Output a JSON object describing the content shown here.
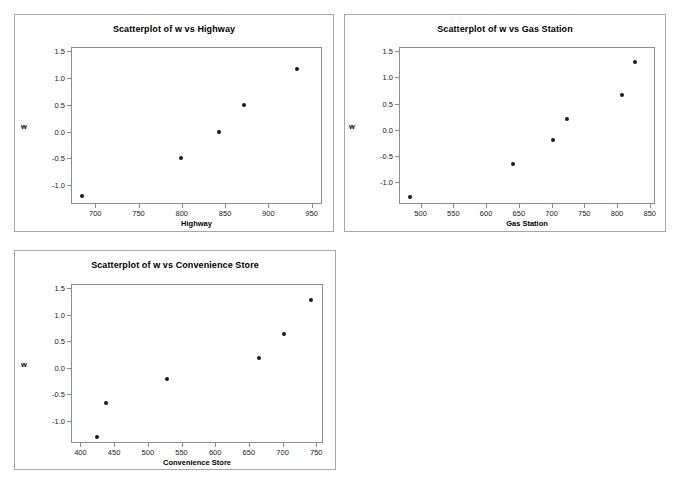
{
  "page": {
    "background": "#ffffff",
    "panel_border_color": "#a8a8a8",
    "frame_border_color": "#8c8c8c",
    "marker_color": "#1a1a1a"
  },
  "chart_data": [
    {
      "id": "highway",
      "type": "scatter",
      "title": "Scatterplot of w vs Highway",
      "xlabel": "Highway",
      "ylabel": "w",
      "xlim": [
        672,
        962
      ],
      "ylim": [
        -1.35,
        1.58
      ],
      "xticks": [
        700,
        750,
        800,
        850,
        900,
        950
      ],
      "yticks": [
        1.5,
        1.0,
        0.5,
        0.0,
        -0.5,
        -1.0
      ],
      "xtick_labels": [
        "700",
        "750",
        "800",
        "850",
        "900",
        "950"
      ],
      "ytick_labels": [
        "1.5",
        "1.0",
        "0.5",
        "0.0",
        "-0.5",
        "-1.0"
      ],
      "grid": false,
      "legend": "none",
      "x": [
        684,
        798,
        842,
        871,
        932
      ],
      "y": [
        -1.18,
        -0.48,
        0.02,
        0.52,
        1.19
      ]
    },
    {
      "id": "gasstation",
      "type": "scatter",
      "title": "Scatterplot of w vs Gas Station",
      "xlabel": "Gas Station",
      "ylabel": "w",
      "xlim": [
        467,
        858
      ],
      "ylim": [
        -1.42,
        1.58
      ],
      "xticks": [
        500,
        550,
        600,
        650,
        700,
        750,
        800,
        850
      ],
      "yticks": [
        1.5,
        1.0,
        0.5,
        0.0,
        -0.5,
        -1.0
      ],
      "xtick_labels": [
        "500",
        "550",
        "600",
        "650",
        "700",
        "750",
        "800",
        "850"
      ],
      "ytick_labels": [
        "1.5",
        "1.0",
        "0.5",
        "0.0",
        "-0.5",
        "-1.0"
      ],
      "grid": false,
      "legend": "none",
      "x": [
        482,
        640,
        701,
        722,
        806,
        826
      ],
      "y": [
        -1.27,
        -0.63,
        -0.18,
        0.23,
        0.68,
        1.32
      ]
    },
    {
      "id": "conveniencestore",
      "type": "scatter",
      "title": "Scatterplot of w vs Convenience Store",
      "xlabel": "Convenience Store",
      "ylabel": "w",
      "xlim": [
        386,
        760
      ],
      "ylim": [
        -1.42,
        1.58
      ],
      "xticks": [
        400,
        450,
        500,
        550,
        600,
        650,
        700,
        750
      ],
      "yticks": [
        1.5,
        1.0,
        0.5,
        0.0,
        -0.5,
        -1.0
      ],
      "xtick_labels": [
        "400",
        "450",
        "500",
        "550",
        "600",
        "650",
        "700",
        "750"
      ],
      "ytick_labels": [
        "1.5",
        "1.0",
        "0.5",
        "0.0",
        "-0.5",
        "-1.0"
      ],
      "grid": false,
      "legend": "none",
      "x": [
        423,
        436,
        527,
        664,
        700,
        741
      ],
      "y": [
        -1.28,
        -0.64,
        -0.19,
        0.21,
        0.65,
        1.29
      ]
    }
  ]
}
